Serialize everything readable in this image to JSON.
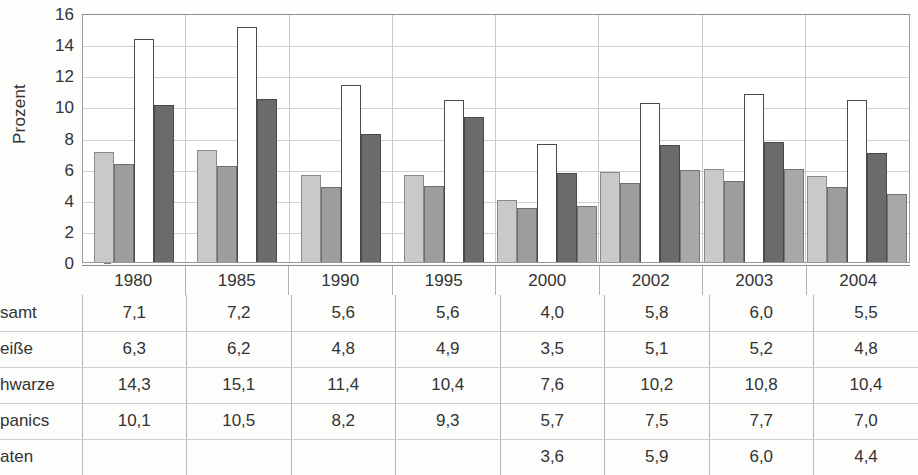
{
  "chart_data": {
    "type": "bar",
    "title": "",
    "subtitle": "",
    "xlabel": "",
    "ylabel": "Prozent",
    "ylim": [
      0,
      16
    ],
    "ytick_step": 2,
    "yticks": [
      16,
      14,
      12,
      10,
      8,
      6,
      4,
      2,
      0
    ],
    "grid": true,
    "legend_position": "none",
    "categories": [
      "1980",
      "1985",
      "1990",
      "1995",
      "2000",
      "2002",
      "2003",
      "2004"
    ],
    "series": [
      {
        "name": "Gesamt",
        "values": [
          7.1,
          7.2,
          5.6,
          5.6,
          4.0,
          5.8,
          6.0,
          5.5
        ]
      },
      {
        "name": "Weiße",
        "values": [
          6.3,
          6.2,
          4.8,
          4.9,
          3.5,
          5.1,
          5.2,
          4.8
        ]
      },
      {
        "name": "Schwarze",
        "values": [
          14.3,
          15.1,
          11.4,
          10.4,
          7.6,
          10.2,
          10.8,
          10.4
        ]
      },
      {
        "name": "Hispanics",
        "values": [
          10.1,
          10.5,
          8.2,
          9.3,
          5.7,
          7.5,
          7.7,
          7.0
        ]
      },
      {
        "name": "Asiaten",
        "values": [
          null,
          null,
          null,
          null,
          3.6,
          5.9,
          6.0,
          4.4
        ]
      }
    ],
    "colors": {
      "series1": "#c9c9c9",
      "series2": "#9d9d9d",
      "series3": "#ffffff",
      "series4": "#6b6b6b",
      "series5": "#a8a8a8",
      "gridline": "#d2d2d2",
      "axis": "#8d8d8d"
    }
  },
  "axis": {
    "y_label": "Prozent",
    "y_ticks": [
      "16",
      "14",
      "12",
      "10",
      "8",
      "6",
      "4",
      "2",
      "0"
    ],
    "x_ticks": [
      "1980",
      "1985",
      "1990",
      "1995",
      "2000",
      "2002",
      "2003",
      "2004"
    ]
  },
  "table": {
    "column_headers": [
      "1980",
      "1985",
      "1990",
      "1995",
      "2000",
      "2002",
      "2003",
      "2004"
    ],
    "rows": [
      {
        "label": "samt",
        "values": [
          "7,1",
          "7,2",
          "5,6",
          "5,6",
          "4,0",
          "5,8",
          "6,0",
          "5,5"
        ]
      },
      {
        "label": "eiße",
        "values": [
          "6,3",
          "6,2",
          "4,8",
          "4,9",
          "3,5",
          "5,1",
          "5,2",
          "4,8"
        ]
      },
      {
        "label": "hwarze",
        "values": [
          "14,3",
          "15,1",
          "11,4",
          "10,4",
          "7,6",
          "10,2",
          "10,8",
          "10,4"
        ]
      },
      {
        "label": "panics",
        "values": [
          "10,1",
          "10,5",
          "8,2",
          "9,3",
          "5,7",
          "7,5",
          "7,7",
          "7,0"
        ]
      },
      {
        "label": "aten",
        "values": [
          "",
          "",
          "",
          "",
          "3,6",
          "5,9",
          "6,0",
          "4,4"
        ]
      }
    ]
  }
}
